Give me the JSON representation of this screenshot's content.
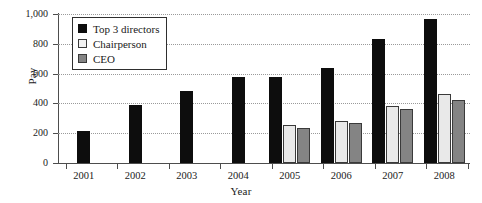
{
  "chart_data": {
    "type": "bar",
    "title": "",
    "subtitle": "",
    "xlabel": "Year",
    "ylabel": "Pay",
    "categories": [
      "2001",
      "2002",
      "2003",
      "2004",
      "2005",
      "2006",
      "2007",
      "2008"
    ],
    "series": [
      {
        "name": "Top 3 directors",
        "color": "#0d0d0d",
        "values": [
          215,
          390,
          480,
          575,
          575,
          640,
          830,
          965
        ]
      },
      {
        "name": "Chairperson",
        "color": "#e9e9e9",
        "values": [
          null,
          null,
          null,
          null,
          255,
          285,
          385,
          465
        ]
      },
      {
        "name": "CEO",
        "color": "#848484",
        "values": [
          null,
          null,
          null,
          null,
          235,
          270,
          365,
          420
        ]
      }
    ],
    "ylim": [
      0,
      1000
    ],
    "yticks": [
      0,
      200,
      400,
      600,
      800,
      1000
    ],
    "ytick_labels": [
      "0",
      "200",
      "400",
      "600",
      "800",
      "1,000"
    ],
    "grid": "horizontal-dotted",
    "legend_position": "top-left-inside"
  },
  "axes": {
    "y_title": "Pay",
    "x_title": "Year"
  },
  "legend": {
    "entries": [
      {
        "label": "Top 3 directors",
        "swatch": "black-square-icon"
      },
      {
        "label": "Chairperson",
        "swatch": "white-square-icon"
      },
      {
        "label": "CEO",
        "swatch": "gray-square-icon"
      }
    ]
  }
}
